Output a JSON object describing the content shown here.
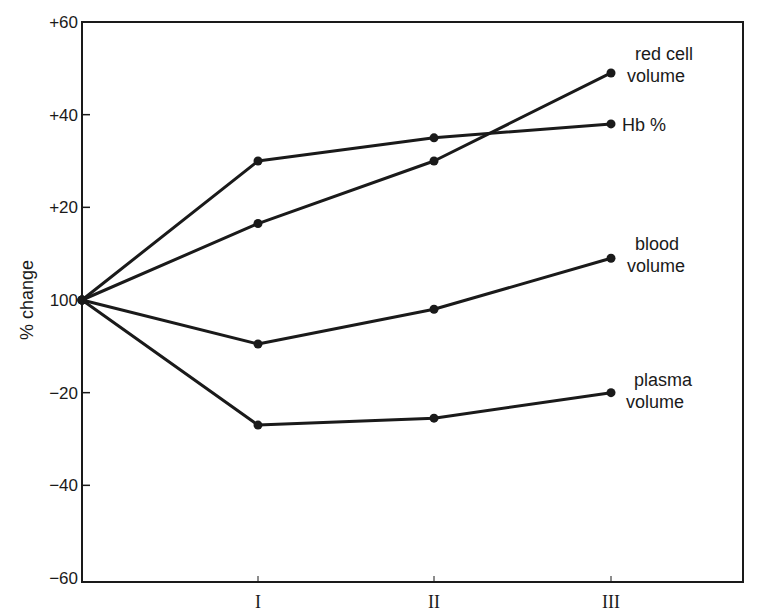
{
  "chart_data": {
    "type": "line",
    "title": "",
    "xlabel": "",
    "ylabel": "% change",
    "categories": [
      "start",
      "I",
      "II",
      "III"
    ],
    "x_tick_labels": [
      "I",
      "II",
      "III"
    ],
    "y_tick_labels": [
      "+60",
      "+40",
      "+20",
      "100",
      "−20",
      "−40",
      "−60"
    ],
    "y_tick_values": [
      60,
      40,
      20,
      0,
      -20,
      -40,
      -60
    ],
    "ylim": [
      -60,
      60
    ],
    "baseline_label": "100",
    "grid": false,
    "legend_position": "inline-right",
    "series": [
      {
        "name": "red cell volume",
        "label_lines": [
          "red cell",
          "volume"
        ],
        "values": [
          0,
          16.5,
          30,
          49
        ]
      },
      {
        "name": "Hb %",
        "label_lines": [
          "Hb %"
        ],
        "values": [
          0,
          30,
          35,
          38
        ]
      },
      {
        "name": "blood volume",
        "label_lines": [
          "blood",
          "volume"
        ],
        "values": [
          0,
          -9.5,
          -2,
          9
        ]
      },
      {
        "name": "plasma volume",
        "label_lines": [
          "plasma",
          "volume"
        ],
        "values": [
          0,
          -27,
          -25.5,
          -20
        ]
      }
    ]
  },
  "colors": {
    "line": "#1a1a1a",
    "background": "#ffffff"
  }
}
